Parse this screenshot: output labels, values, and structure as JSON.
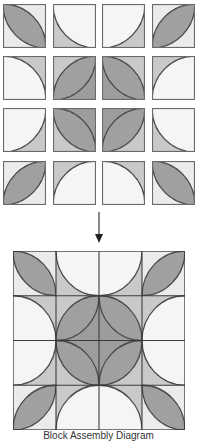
{
  "colors": {
    "outline": "#4a4a4a",
    "leaf": "#a0a0a0",
    "white": "#f5f5f5",
    "light_corner": "#ebebeb",
    "gray_corner": "#c9c9c9",
    "dark_corner": "#9d9d9d",
    "arrow": "#333333"
  },
  "blocks": [
    {
      "row": 0,
      "col": 0,
      "type": "leaf",
      "diag": "tlbr",
      "corners": {
        "bl": "light_corner",
        "tr": "light_corner"
      }
    },
    {
      "row": 0,
      "col": 1,
      "type": "disc",
      "center": "tr",
      "corner": "gray_corner"
    },
    {
      "row": 0,
      "col": 2,
      "type": "disc",
      "center": "tl",
      "corner": "gray_corner"
    },
    {
      "row": 0,
      "col": 3,
      "type": "leaf",
      "diag": "bltr",
      "corners": {
        "tl": "light_corner",
        "br": "light_corner"
      }
    },
    {
      "row": 1,
      "col": 0,
      "type": "disc",
      "center": "bl",
      "corner": "gray_corner"
    },
    {
      "row": 1,
      "col": 1,
      "type": "leaf",
      "diag": "bltr",
      "corners": {
        "tl": "gray_corner",
        "br": "dark_corner"
      }
    },
    {
      "row": 1,
      "col": 2,
      "type": "leaf",
      "diag": "tlbr",
      "corners": {
        "bl": "dark_corner",
        "tr": "gray_corner"
      }
    },
    {
      "row": 1,
      "col": 3,
      "type": "disc",
      "center": "br",
      "corner": "gray_corner"
    },
    {
      "row": 2,
      "col": 0,
      "type": "disc",
      "center": "tl",
      "corner": "gray_corner"
    },
    {
      "row": 2,
      "col": 1,
      "type": "leaf",
      "diag": "tlbr",
      "corners": {
        "bl": "gray_corner",
        "tr": "dark_corner"
      }
    },
    {
      "row": 2,
      "col": 2,
      "type": "leaf",
      "diag": "bltr",
      "corners": {
        "tl": "dark_corner",
        "br": "gray_corner"
      }
    },
    {
      "row": 2,
      "col": 3,
      "type": "disc",
      "center": "tr",
      "corner": "gray_corner"
    },
    {
      "row": 3,
      "col": 0,
      "type": "leaf",
      "diag": "bltr",
      "corners": {
        "tl": "light_corner",
        "br": "light_corner"
      }
    },
    {
      "row": 3,
      "col": 1,
      "type": "disc",
      "center": "br",
      "corner": "gray_corner"
    },
    {
      "row": 3,
      "col": 2,
      "type": "disc",
      "center": "bl",
      "corner": "gray_corner"
    },
    {
      "row": 3,
      "col": 3,
      "type": "leaf",
      "diag": "tlbr",
      "corners": {
        "bl": "light_corner",
        "tr": "light_corner"
      }
    }
  ],
  "layout": {
    "col_x": [
      3,
      53,
      102,
      152
    ],
    "row_y": [
      4,
      56,
      108,
      161
    ]
  },
  "arrow": {
    "direction": "down",
    "icon": "arrow-down-icon"
  },
  "caption": "Block Assembly Diagram"
}
